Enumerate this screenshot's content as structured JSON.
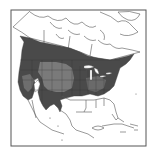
{
  "map": {
    "type": "species range map",
    "region": "North America",
    "frame": {
      "x": 11,
      "y": 10,
      "width": 135,
      "height": 136
    },
    "colors": {
      "background": "#ffffff",
      "border": "#555555",
      "land_outline": "#444444",
      "range_primary": "#4a4a4a",
      "range_secondary": "#7a7a7a",
      "water_gaps": "#ffffff"
    },
    "legend": [
      {
        "label": "primary range (dark shading)",
        "color": "#4a4a4a"
      },
      {
        "label": "secondary range (lighter shading)",
        "color": "#7a7a7a"
      }
    ]
  }
}
